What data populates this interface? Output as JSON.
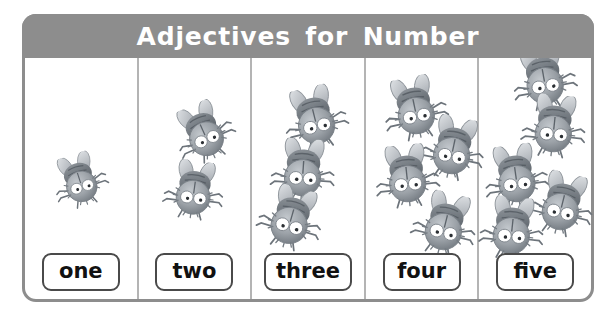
{
  "worksheet": {
    "title": "Adjectives for Number",
    "frame_border_color": "#8d8d8d",
    "header_bg_color": "#8d8d8d",
    "header_text_color": "#ffffff",
    "divider_color": "#b4b4b4",
    "label_border_color": "#4a4a4a",
    "background_color": "#ffffff",
    "bug_body_color": "#9aa0a6",
    "bug_wing_color": "#c9cdd2",
    "bug_eye_color": "#ffffff",
    "columns": [
      {
        "label": "one",
        "count": 1,
        "bugs": [
          {
            "x": 18,
            "y": 88,
            "scale": 0.78,
            "rot": -18
          }
        ]
      },
      {
        "label": "two",
        "count": 2,
        "bugs": [
          {
            "x": 28,
            "y": 40,
            "scale": 0.86,
            "rot": -24
          },
          {
            "x": 18,
            "y": 98,
            "scale": 0.86,
            "rot": 8
          }
        ]
      },
      {
        "label": "three",
        "count": 3,
        "bugs": [
          {
            "x": 26,
            "y": 26,
            "scale": 0.92,
            "rot": -14
          },
          {
            "x": 14,
            "y": 78,
            "scale": 0.92,
            "rot": 4
          },
          {
            "x": 2,
            "y": 126,
            "scale": 0.92,
            "rot": 16
          }
        ]
      },
      {
        "label": "four",
        "count": 4,
        "bugs": [
          {
            "x": 12,
            "y": 16,
            "scale": 0.92,
            "rot": -12
          },
          {
            "x": 50,
            "y": 56,
            "scale": 0.92,
            "rot": 12
          },
          {
            "x": 4,
            "y": 84,
            "scale": 0.92,
            "rot": -6
          },
          {
            "x": 42,
            "y": 132,
            "scale": 0.92,
            "rot": 14
          }
        ]
      },
      {
        "label": "five",
        "count": 5,
        "bugs": [
          {
            "x": 28,
            "y": -14,
            "scale": 0.92,
            "rot": -10
          },
          {
            "x": 38,
            "y": 34,
            "scale": 0.92,
            "rot": 6
          },
          {
            "x": 0,
            "y": 84,
            "scale": 0.92,
            "rot": -8
          },
          {
            "x": 46,
            "y": 112,
            "scale": 0.92,
            "rot": 14
          },
          {
            "x": -4,
            "y": 136,
            "scale": 0.92,
            "rot": 6
          }
        ]
      }
    ]
  }
}
